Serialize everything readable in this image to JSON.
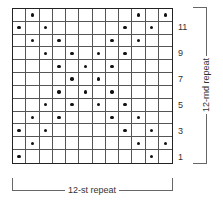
{
  "chart": {
    "columns": 12,
    "rows": 12,
    "dot_symbol": "dot",
    "row_dots": {
      "12": [
        2,
        10,
        12
      ],
      "11": [
        1,
        3,
        9,
        11
      ],
      "10": [
        2,
        4,
        8,
        10
      ],
      "9": [
        3,
        5,
        7,
        9
      ],
      "8": [
        4,
        6,
        8
      ],
      "7": [
        5,
        7
      ],
      "6": [
        4,
        6,
        8
      ],
      "5": [
        3,
        5,
        7,
        9
      ],
      "4": [
        2,
        4,
        8,
        10
      ],
      "3": [
        1,
        3,
        9,
        11
      ],
      "2": [
        2,
        10,
        12
      ],
      "1": [
        1,
        11
      ]
    },
    "row_numbers": [
      "11",
      "9",
      "7",
      "5",
      "3",
      "1"
    ]
  },
  "labels": {
    "row_repeat": "12-rnd repeat",
    "stitch_repeat": "12-st repeat"
  },
  "colors": {
    "dot": "#111111",
    "grid": "#555555",
    "text": "#333333"
  }
}
